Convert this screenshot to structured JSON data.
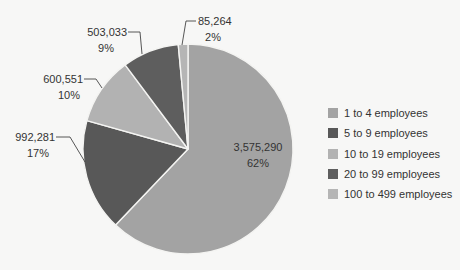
{
  "chart_data": {
    "type": "pie",
    "title": "",
    "start_angle_deg": 0,
    "direction": "clockwise",
    "categories": [
      "1 to 4 employees",
      "5 to 9 employees",
      "10 to 19 employees",
      "20 to 99 employees",
      "100 to 499 employees"
    ],
    "values": [
      3575290,
      992281,
      600551,
      503033,
      85264
    ],
    "value_labels": [
      "3,575,290",
      "992,281",
      "600,551",
      "503,033",
      "85,264"
    ],
    "percent_labels": [
      "62%",
      "17%",
      "10%",
      "9%",
      "2%"
    ],
    "colors": [
      "#a3a3a3",
      "#585858",
      "#b2b2b2",
      "#5e5e5e",
      "#b5b5b5"
    ],
    "legend_position": "right"
  },
  "legend": {
    "items": [
      {
        "label": "1 to 4 employees",
        "color": "#a3a3a3"
      },
      {
        "label": "5 to 9 employees",
        "color": "#585858"
      },
      {
        "label": "10 to 19 employees",
        "color": "#b2b2b2"
      },
      {
        "label": "20 to 99 employees",
        "color": "#5e5e5e"
      },
      {
        "label": "100 to 499 employees",
        "color": "#b5b5b5"
      }
    ]
  }
}
